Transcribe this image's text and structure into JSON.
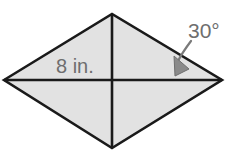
{
  "figure": {
    "name": "rhombus-with-diagonals",
    "type": "geometry-diagram",
    "background_color": "#ffffff",
    "shape": {
      "name": "rhombus",
      "fill_color": "#e2e2e2",
      "stroke_color": "#1a1a1a",
      "stroke_width": 2.6,
      "vertices": {
        "left": [
          4,
          80
        ],
        "top": [
          112,
          14
        ],
        "right": [
          222,
          80
        ],
        "bottom": [
          112,
          148
        ]
      }
    },
    "diagonals": {
      "name": "diagonals",
      "stroke_color": "#1a1a1a",
      "stroke_width": 2.6,
      "horizontal": [
        [
          4,
          80
        ],
        [
          222,
          80
        ]
      ],
      "vertical": [
        [
          112,
          14
        ],
        [
          112,
          148
        ]
      ]
    },
    "labels": {
      "side_length": {
        "text": "8 in.",
        "color": "#6e6e6e",
        "font_size": 20,
        "x": 56,
        "y": 73
      },
      "angle": {
        "text": "30°",
        "color": "#6e6e6e",
        "font_size": 21,
        "x": 188,
        "y": 38
      }
    },
    "annotation_arrow": {
      "name": "angle-pointer-arrow",
      "color": "#7a7a7a",
      "stroke_width": 2.2,
      "curve": "M 191 40 C 186 48 182 54 179 60",
      "arrowhead": [
        [
          176,
          75
        ],
        [
          175,
          58
        ],
        [
          189,
          68
        ]
      ]
    }
  }
}
